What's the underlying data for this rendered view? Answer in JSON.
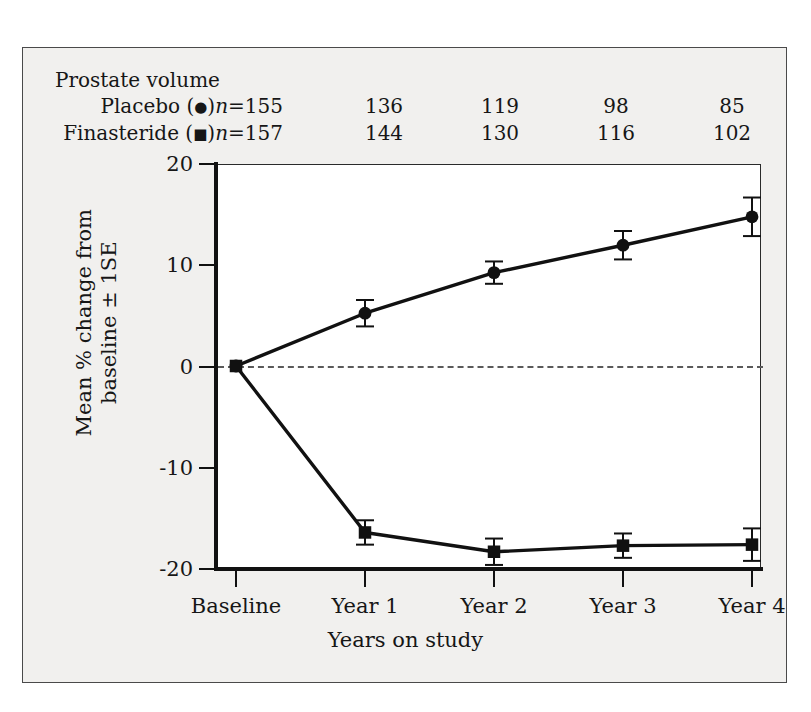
{
  "figure": {
    "background_color": "#f1f0ee",
    "plot_background_color": "#ffffff",
    "ink_color": "#111111"
  },
  "count_table": {
    "title": "Prostate volume",
    "rows": [
      {
        "name": "Placebo",
        "symbol": "●",
        "symbol_name": "filled-circle",
        "n_prefix": "n",
        "n_equals": "=155",
        "label_text": "Placebo (●)n =155",
        "values": [
          "136",
          "119",
          "98",
          "85"
        ]
      },
      {
        "name": "Finasteride",
        "symbol": "■",
        "symbol_name": "filled-square",
        "n_prefix": "n",
        "n_equals": "=157",
        "label_text": "Finasteride (■)n =157",
        "values": [
          "144",
          "130",
          "116",
          "102"
        ]
      }
    ]
  },
  "chart_data": {
    "type": "line",
    "title": "",
    "xlabel": "Years on study",
    "ylabel": "Mean % change from baseline ± 1SE",
    "ylabel_line1": "Mean % change from",
    "ylabel_line2": "baseline ± 1SE",
    "categories": [
      "Baseline",
      "Year 1",
      "Year 2",
      "Year 3",
      "Year 4"
    ],
    "ylim": [
      -20,
      20
    ],
    "yticks": [
      20,
      10,
      0,
      -10,
      -20
    ],
    "ytick_labels": [
      "20",
      "10",
      "0",
      "-10",
      "-20"
    ],
    "grid": false,
    "zero_reference_line": 0,
    "legend_position": "above-plot-as-table",
    "series": [
      {
        "name": "Placebo",
        "marker": "circle",
        "values": [
          0,
          5.2,
          9.2,
          11.9,
          14.7
        ],
        "errors": [
          0,
          1.3,
          1.1,
          1.4,
          1.9
        ]
      },
      {
        "name": "Finasteride",
        "marker": "square",
        "values": [
          0,
          -16.4,
          -18.3,
          -17.7,
          -17.6
        ],
        "errors": [
          0,
          1.2,
          1.3,
          1.2,
          1.6
        ]
      }
    ]
  }
}
